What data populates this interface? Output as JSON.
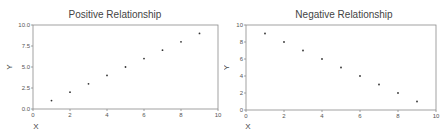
{
  "chart_data": [
    {
      "type": "scatter",
      "title": "Positive Relationship",
      "xlabel": "X",
      "ylabel": "Y",
      "xlim": [
        0,
        10
      ],
      "ylim": [
        0,
        10
      ],
      "x_ticks": [
        "0",
        "2",
        "4",
        "6",
        "8",
        "10"
      ],
      "y_ticks": [
        "0.0",
        "2.5",
        "5.0",
        "7.5",
        "10.0"
      ],
      "grid": false,
      "x": [
        1,
        2,
        3,
        4,
        5,
        6,
        7,
        8,
        9
      ],
      "y": [
        1,
        2,
        3,
        4,
        5,
        6,
        7,
        8,
        9
      ]
    },
    {
      "type": "scatter",
      "title": "Negative Relationship",
      "xlabel": "X",
      "ylabel": "Y",
      "xlim": [
        0,
        10
      ],
      "ylim": [
        0,
        10
      ],
      "x_ticks": [
        "0",
        "2",
        "4",
        "6",
        "8",
        "10"
      ],
      "y_ticks": [
        "0",
        "2",
        "4",
        "6",
        "8",
        "10"
      ],
      "grid": false,
      "x": [
        1,
        2,
        3,
        4,
        5,
        6,
        7,
        8,
        9
      ],
      "y": [
        9,
        8,
        7,
        6,
        5,
        4,
        3,
        2,
        1
      ]
    }
  ],
  "colors": {
    "axis": "#8a8a8a",
    "point": "#333333",
    "text": "#444444"
  }
}
